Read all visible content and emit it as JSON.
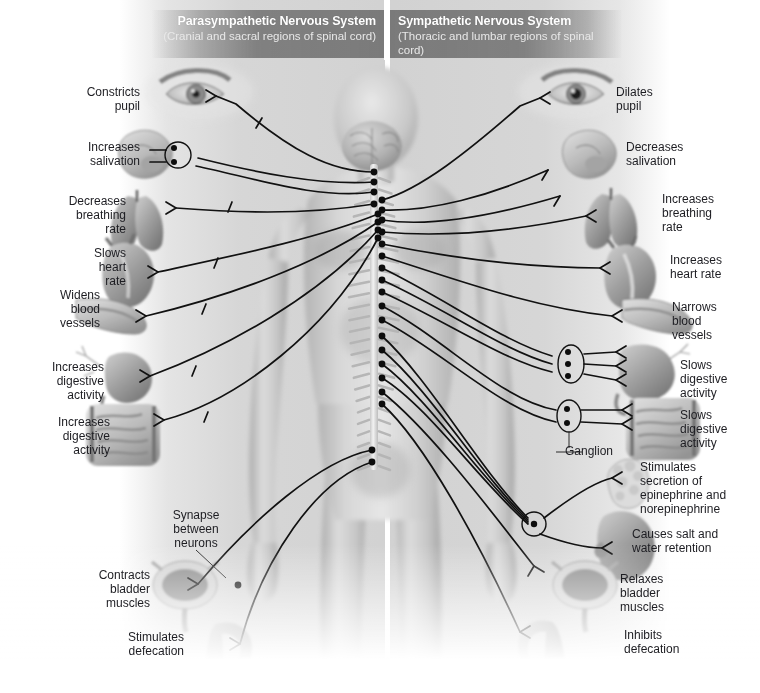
{
  "figure": {
    "background_color": "#ffffff",
    "panel_color": "#cacaca",
    "header_bar_color": "#7a7a7a",
    "nerve_line_color": "#111111",
    "label_text_color": "#1d1d22"
  },
  "headers": [
    {
      "id": "parasympathetic",
      "title": "Parasympathetic Nervous System",
      "subtitle": "(Cranial and sacral\nregions of spinal cord)",
      "align": "right"
    },
    {
      "id": "sympathetic",
      "title": "Sympathetic Nervous System",
      "subtitle": "(Thoracic and lumbar\nregions of spinal cord)",
      "align": "left"
    }
  ],
  "left_labels": [
    {
      "id": "constricts-pupil",
      "text": "Constricts\npupil",
      "x": 62,
      "y": 85,
      "w": 78
    },
    {
      "id": "increases-salivation",
      "text": "Increases\nsalivation",
      "x": 46,
      "y": 140,
      "w": 94
    },
    {
      "id": "decreases-breathing",
      "text": "Decreases\nbreathing\nrate",
      "x": 38,
      "y": 194,
      "w": 88
    },
    {
      "id": "slows-heart-rate",
      "text": "Slows\nheart\nrate",
      "x": 54,
      "y": 246,
      "w": 72
    },
    {
      "id": "widens-blood-vessels",
      "text": "Widens\nblood\nvessels",
      "x": 18,
      "y": 288,
      "w": 82
    },
    {
      "id": "increases-digestive-stomach",
      "text": "Increases\ndigestive\nactivity",
      "x": 18,
      "y": 360,
      "w": 86
    },
    {
      "id": "increases-digestive-intestine",
      "text": "Increases\ndigestive\nactivity",
      "x": 24,
      "y": 415,
      "w": 86
    },
    {
      "id": "synapse-between-neurons",
      "text": "Synapse\nbetween\nneurons",
      "x": 160,
      "y": 508,
      "w": 72
    },
    {
      "id": "contracts-bladder",
      "text": "Contracts\nbladder\nmuscles",
      "x": 66,
      "y": 568,
      "w": 84
    },
    {
      "id": "stimulates-defecation",
      "text": "Stimulates\ndefecation",
      "x": 96,
      "y": 630,
      "w": 88
    }
  ],
  "right_labels": [
    {
      "id": "dilates-pupil",
      "text": "Dilates\npupil",
      "x": 616,
      "y": 85,
      "w": 80
    },
    {
      "id": "decreases-salivation",
      "text": "Decreases\nsalivation",
      "x": 626,
      "y": 140,
      "w": 96
    },
    {
      "id": "increases-breathing",
      "text": "Increases\nbreathing\nrate",
      "x": 662,
      "y": 192,
      "w": 88
    },
    {
      "id": "increases-heart-rate",
      "text": "Increases\nheart rate",
      "x": 670,
      "y": 253,
      "w": 90
    },
    {
      "id": "narrows-blood-vessels",
      "text": "Narrows\nblood\nvessels",
      "x": 672,
      "y": 300,
      "w": 84
    },
    {
      "id": "slows-digestive-stomach",
      "text": "Slows\ndigestive\nactivity",
      "x": 680,
      "y": 358,
      "w": 80
    },
    {
      "id": "slows-digestive-intestine",
      "text": "Slows\ndigestive\nactivity",
      "x": 680,
      "y": 408,
      "w": 80
    },
    {
      "id": "ganglion",
      "text": "Ganglion",
      "x": 556,
      "y": 444,
      "w": 66
    },
    {
      "id": "stimulates-secretion",
      "text": "Stimulates\nsecretion of\nepinephrine and\nnorepinephrine",
      "x": 640,
      "y": 460,
      "w": 118
    },
    {
      "id": "causes-salt-water-retention",
      "text": "Causes salt and\nwater retention",
      "x": 632,
      "y": 527,
      "w": 124
    },
    {
      "id": "relaxes-bladder",
      "text": "Relaxes\nbladder\nmuscles",
      "x": 620,
      "y": 572,
      "w": 82
    },
    {
      "id": "inhibits-defecation",
      "text": "Inhibits\ndefecation",
      "x": 624,
      "y": 628,
      "w": 86
    }
  ],
  "organs": [
    {
      "id": "eye-left",
      "name": "eye",
      "side": "left",
      "x": 148,
      "y": 64,
      "w": 112,
      "h": 58
    },
    {
      "id": "salivary-gland-left",
      "name": "salivary-gland",
      "side": "left",
      "x": 118,
      "y": 128,
      "w": 68,
      "h": 58
    },
    {
      "id": "lungs-left",
      "name": "lungs",
      "side": "left",
      "x": 96,
      "y": 188,
      "w": 86,
      "h": 62
    },
    {
      "id": "heart-left",
      "name": "heart",
      "side": "left",
      "x": 96,
      "y": 236,
      "w": 74,
      "h": 72
    },
    {
      "id": "blood-vessel-left",
      "name": "blood-vessel",
      "side": "left",
      "x": 66,
      "y": 295,
      "w": 80,
      "h": 42
    },
    {
      "id": "stomach-left",
      "name": "stomach",
      "side": "left",
      "x": 68,
      "y": 348,
      "w": 86,
      "h": 60
    },
    {
      "id": "intestine-left",
      "name": "intestine",
      "side": "left",
      "x": 82,
      "y": 402,
      "w": 84,
      "h": 66
    },
    {
      "id": "bladder-left",
      "name": "bladder",
      "side": "left",
      "x": 152,
      "y": 562,
      "w": 66,
      "h": 62
    },
    {
      "id": "rectum-left",
      "name": "rectum",
      "side": "left",
      "x": 182,
      "y": 620,
      "w": 76,
      "h": 62
    },
    {
      "id": "eye-right",
      "name": "eye",
      "side": "right",
      "x": 540,
      "y": 64,
      "w": 112,
      "h": 58
    },
    {
      "id": "salivary-gland-right",
      "name": "salivary-gland",
      "side": "right",
      "x": 562,
      "y": 128,
      "w": 68,
      "h": 58
    },
    {
      "id": "lungs-right",
      "name": "lungs",
      "side": "right",
      "x": 588,
      "y": 186,
      "w": 84,
      "h": 62
    },
    {
      "id": "heart-right",
      "name": "heart",
      "side": "right",
      "x": 600,
      "y": 238,
      "w": 74,
      "h": 72
    },
    {
      "id": "blood-vessel-right",
      "name": "blood-vessel",
      "side": "right",
      "x": 612,
      "y": 296,
      "w": 80,
      "h": 42
    },
    {
      "id": "stomach-right",
      "name": "stomach",
      "side": "right",
      "x": 618,
      "y": 342,
      "w": 86,
      "h": 62
    },
    {
      "id": "intestine-right",
      "name": "intestine",
      "side": "right",
      "x": 622,
      "y": 396,
      "w": 80,
      "h": 66
    },
    {
      "id": "adrenal-gland-right",
      "name": "adrenal-gland",
      "side": "right",
      "x": 614,
      "y": 460,
      "w": 56,
      "h": 52
    },
    {
      "id": "kidney-right",
      "name": "kidney",
      "side": "right",
      "x": 600,
      "y": 508,
      "w": 72,
      "h": 68
    },
    {
      "id": "bladder-right",
      "name": "bladder",
      "side": "right",
      "x": 552,
      "y": 562,
      "w": 66,
      "h": 62
    },
    {
      "id": "rectum-right",
      "name": "rectum",
      "side": "right",
      "x": 518,
      "y": 618,
      "w": 76,
      "h": 62
    }
  ],
  "body": {
    "id": "human-figure",
    "description": "Anterior view of a male human body showing brain and spinal cord",
    "brain": {
      "x": 340,
      "y": 124,
      "w": 60,
      "h": 52
    },
    "spine": {
      "x": 369,
      "y": 168,
      "w": 14,
      "h": 300
    }
  },
  "ganglia": [
    {
      "id": "ganglion-salivary-left",
      "shape": "circle",
      "cx": 178,
      "cy": 154,
      "r": 13,
      "synapses": 2
    },
    {
      "id": "ganglion-stomach-right",
      "shape": "ellipse",
      "cx": 571,
      "cy": 364,
      "rx": 13,
      "ry": 19,
      "synapses": 3
    },
    {
      "id": "ganglion-intestine-right",
      "shape": "ellipse",
      "cx": 569,
      "cy": 416,
      "rx": 12,
      "ry": 16,
      "synapses": 2
    },
    {
      "id": "ganglion-adrenal-right",
      "shape": "circle",
      "cx": 534,
      "cy": 524,
      "r": 12,
      "synapses": 1
    }
  ]
}
